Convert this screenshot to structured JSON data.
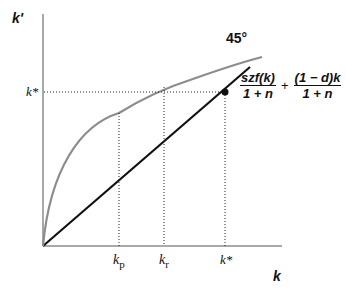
{
  "axes": {
    "y_label": "k'",
    "x_label": "k"
  },
  "labels": {
    "kstar_y": "k*",
    "angle": "45°",
    "kp": "k",
    "kp_sub": "p",
    "kr": "k",
    "kr_sub": "r",
    "kstar_x": "k*"
  },
  "formula": {
    "num1": "szf(k)",
    "den1": "1 + n",
    "plus": "+",
    "num2": "(1 − d)k",
    "den2": "1 + n"
  },
  "colors": {
    "curve": "#8c8c8c",
    "line": "#111111",
    "axis": "#8c8c8c"
  }
}
